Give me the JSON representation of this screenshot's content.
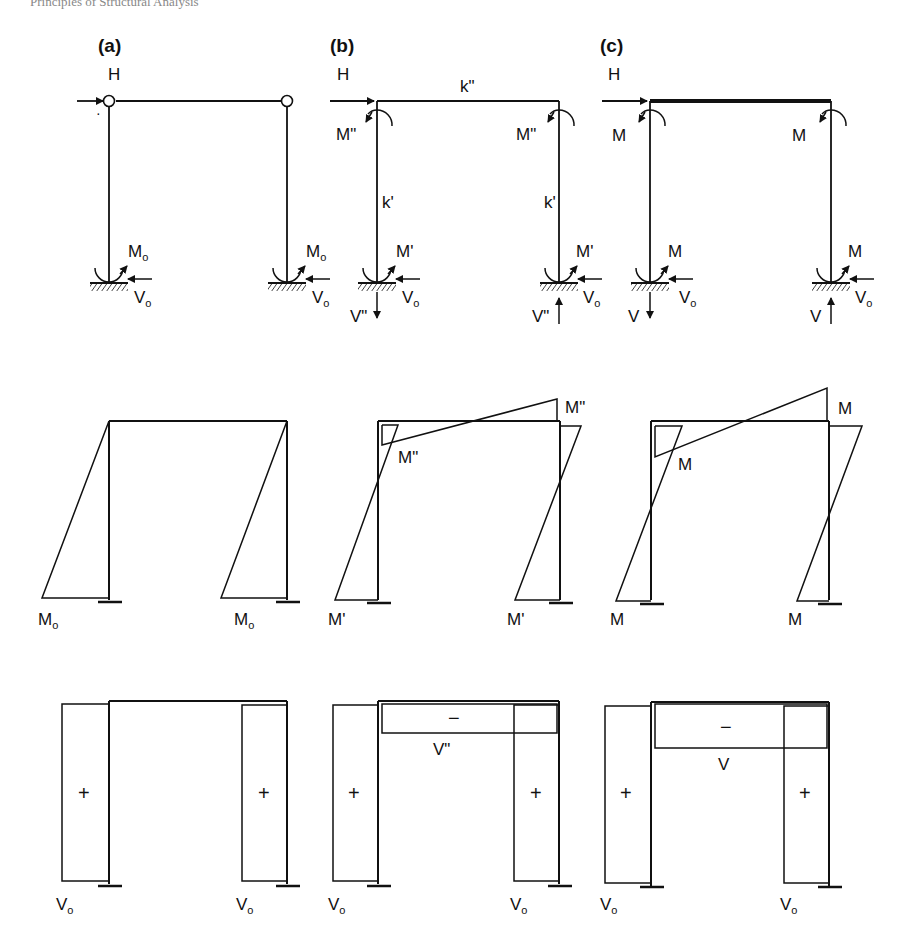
{
  "header": {
    "left_text": "Principles of Structural Analysis",
    "right_text": ""
  },
  "panels": [
    {
      "id": "a",
      "label": "(a)",
      "load": "H",
      "top_moment_label": "",
      "beam_stiffness": "",
      "column_stiffness": "",
      "base_moment": "M",
      "base_moment_sub": "o",
      "base_shear": "V",
      "base_shear_sub": "o",
      "vertical_reaction": "",
      "moment_diagram": {
        "base_left": "M",
        "base_left_sub": "o",
        "base_right": "M",
        "base_right_sub": "o",
        "beam_end": ""
      },
      "shear_diagram": {
        "column_sign": "+",
        "beam_sign": "",
        "beam_label": "",
        "base_left": "V",
        "base_left_sub": "o",
        "base_right": "V",
        "base_right_sub": "o"
      }
    },
    {
      "id": "b",
      "label": "(b)",
      "load": "H",
      "top_moment_label": "M\"",
      "beam_stiffness": "k\"",
      "column_stiffness": "k'",
      "base_moment": "M'",
      "base_shear": "V",
      "base_shear_sub": "o",
      "vertical_reaction": "V\"",
      "moment_diagram": {
        "base_left": "M'",
        "base_right": "M'",
        "beam_end": "M\""
      },
      "shear_diagram": {
        "column_sign": "+",
        "beam_sign": "−",
        "beam_label": "V\"",
        "base_left": "V",
        "base_left_sub": "o",
        "base_right": "V",
        "base_right_sub": "o"
      }
    },
    {
      "id": "c",
      "label": "(c)",
      "load": "H",
      "top_moment_label": "M",
      "beam_stiffness": "",
      "column_stiffness": "",
      "base_moment": "M",
      "base_shear": "V",
      "base_shear_sub": "o",
      "vertical_reaction": "V",
      "moment_diagram": {
        "base_left": "M",
        "base_right": "M",
        "beam_end": "M"
      },
      "shear_diagram": {
        "column_sign": "+",
        "beam_sign": "−",
        "beam_label": "V",
        "base_left": "V",
        "base_left_sub": "o",
        "base_right": "V",
        "base_right_sub": "o"
      }
    }
  ]
}
